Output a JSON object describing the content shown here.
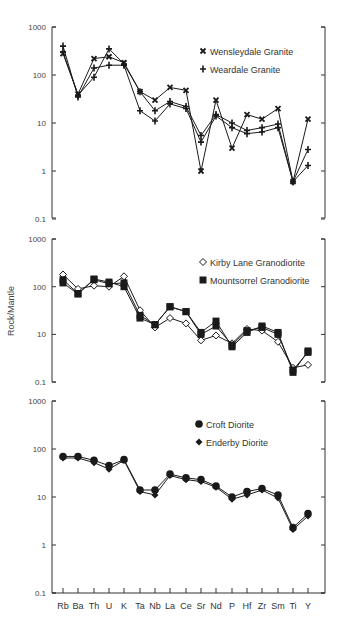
{
  "chart_data": [
    {
      "type": "line",
      "yscale": "log",
      "title": "",
      "xlabel": "",
      "ylabel": "",
      "ylim": [
        0.1,
        1000
      ],
      "yticks": [
        "1000",
        "100",
        "10",
        "1",
        "0.1"
      ],
      "categories": [
        "Rb",
        "Ba",
        "Th",
        "U",
        "K",
        "Ta",
        "Nb",
        "La",
        "Ce",
        "Sr",
        "Nd",
        "P",
        "Hf",
        "Zr",
        "Sm",
        "Ti",
        "Y"
      ],
      "legend": [
        {
          "label": "Wensleydale Granite",
          "marker": "x"
        },
        {
          "label": "Weardale Granite",
          "marker": "+"
        }
      ],
      "legend_position": "upper right",
      "series": [
        {
          "name": "Wensleydale Granite",
          "marker": "x",
          "values": [
            280,
            40,
            220,
            240,
            180,
            45,
            30,
            55,
            48,
            1.0,
            30,
            3.0,
            15,
            12,
            20,
            0.6,
            12
          ]
        },
        {
          "name": "Weardale Granite",
          "marker": "+",
          "values": [
            400,
            35,
            140,
            160,
            160,
            18,
            11,
            25,
            20,
            4.0,
            14,
            8.0,
            6.0,
            6.5,
            8.0,
            0.6,
            1.3
          ]
        },
        {
          "name": "Weardale Granite (2)",
          "marker": "+",
          "values": [
            300,
            38,
            90,
            350,
            170,
            45,
            18,
            28,
            22,
            5.5,
            15,
            10,
            7.0,
            8.0,
            9.5,
            0.6,
            2.8
          ]
        }
      ]
    },
    {
      "type": "line",
      "yscale": "log",
      "title": "",
      "xlabel": "",
      "ylabel": "Rock/Mantle",
      "ylim": [
        1,
        1000
      ],
      "yticks": [
        "1000",
        "100",
        "10",
        "0.1"
      ],
      "categories": [
        "Rb",
        "Ba",
        "Th",
        "U",
        "K",
        "Ta",
        "Nb",
        "La",
        "Ce",
        "Sr",
        "Nd",
        "P",
        "Hf",
        "Zr",
        "Sm",
        "Ti",
        "Y"
      ],
      "legend": [
        {
          "label": "Kirby Lane Granodiorite",
          "marker": "open-diamond"
        },
        {
          "label": "Mountsorrel Granodiorite",
          "marker": "filled-square"
        }
      ],
      "legend_position": "upper right",
      "series": [
        {
          "name": "Kirby Lane Granodiorite",
          "marker": "open-diamond",
          "values": [
            180,
            90,
            105,
            100,
            165,
            32,
            14,
            22,
            17,
            7.5,
            9.5,
            6.5,
            13,
            12,
            7.0,
            2.0,
            2.3
          ]
        },
        {
          "name": "Mountsorrel Granodiorite",
          "marker": "filled-square",
          "values": [
            120,
            70,
            145,
            125,
            100,
            22,
            16,
            38,
            30,
            11,
            19,
            5.5,
            11,
            15,
            11,
            1.6,
            4.5
          ]
        },
        {
          "name": "Mountsorrel Granodiorite (2)",
          "marker": "filled-square",
          "values": [
            140,
            72,
            140,
            115,
            120,
            25,
            16,
            38,
            30,
            10,
            15,
            6.0,
            12,
            14,
            10,
            1.8,
            4.2
          ]
        }
      ]
    },
    {
      "type": "line",
      "yscale": "log",
      "title": "",
      "xlabel": "",
      "ylabel": "",
      "ylim": [
        0.1,
        1000
      ],
      "yticks": [
        "1000",
        "100",
        "10",
        "1",
        "0.1"
      ],
      "categories": [
        "Rb",
        "Ba",
        "Th",
        "U",
        "K",
        "Ta",
        "Nb",
        "La",
        "Ce",
        "Sr",
        "Nd",
        "P",
        "Hf",
        "Zr",
        "Sm",
        "Ti",
        "Y"
      ],
      "legend": [
        {
          "label": "Croft Diorite",
          "marker": "filled-circle"
        },
        {
          "label": "Enderby Diorite",
          "marker": "filled-diamond"
        }
      ],
      "legend_position": "upper right",
      "series": [
        {
          "name": "Croft Diorite",
          "marker": "filled-circle",
          "values": [
            70,
            70,
            58,
            45,
            60,
            14,
            14,
            30,
            25,
            23,
            17,
            10,
            13,
            15,
            11,
            2.3,
            4.5
          ]
        },
        {
          "name": "Enderby Diorite",
          "marker": "filled-diamond",
          "values": [
            65,
            65,
            52,
            38,
            58,
            13,
            11,
            28,
            23,
            21,
            16,
            9,
            11,
            14,
            9.5,
            2.1,
            4.0
          ]
        }
      ]
    }
  ],
  "panels": [
    {
      "top": 27,
      "decade_px": 48,
      "ymax_exp": 3,
      "tick_labels": [
        "1000",
        "100",
        "10",
        "1",
        "0.1"
      ],
      "bottom": 218
    },
    {
      "top": 239,
      "decade_px": 47.7,
      "ymax_exp": 3,
      "tick_labels": [
        "1000",
        "100",
        "10",
        "0.1"
      ],
      "bottom": 382
    },
    {
      "top": 401,
      "decade_px": 48,
      "ymax_exp": 3,
      "tick_labels": [
        "1000",
        "100",
        "10",
        "1",
        "0.1"
      ],
      "bottom": 593
    }
  ],
  "axis": {
    "ylabel": "Rock/Mantle"
  },
  "legends": {
    "top": [
      "Wensleydale Granite",
      "Weardale Granite"
    ],
    "middle": [
      "Kirby Lane Granodiorite",
      "Mountsorrel Granodiorite"
    ],
    "bottom": [
      "Croft Diorite",
      "Enderby Diorite"
    ]
  },
  "colors": {
    "ink": "#1a1a1a",
    "axis": "#333333",
    "text": "#444444"
  }
}
